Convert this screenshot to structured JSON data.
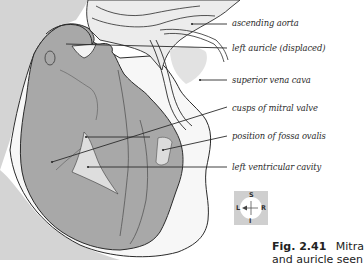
{
  "figure": {
    "caption_number": "Fig. 2.41",
    "caption_text": "Mitra",
    "caption_line2": "and auricle seen"
  },
  "labels": [
    {
      "id": "ascending-aorta",
      "text": "ascending aorta"
    },
    {
      "id": "left-auricle",
      "text": "left auricle (displaced)"
    },
    {
      "id": "superior-vena-cava",
      "text": "superior vena cava"
    },
    {
      "id": "cusps-mitral-valve",
      "text": "cusps of mitral valve"
    },
    {
      "id": "fossa-ovalis",
      "text": "position of fossa ovalis"
    },
    {
      "id": "left-ventricular-cavity",
      "text": "left ventricular cavity"
    }
  ],
  "compass": {
    "top": "S",
    "bottom": "I",
    "left": "L",
    "right": "R"
  },
  "colors": {
    "tissue": "#a8a8a8",
    "background_panel": "#d4d4d4",
    "outline": "#2b2b2b",
    "white_band": "#f7f7f7"
  }
}
